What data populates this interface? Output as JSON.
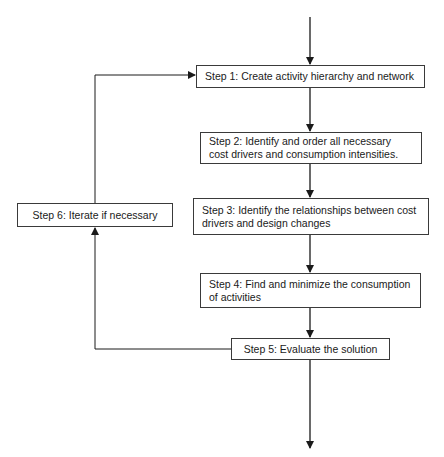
{
  "diagram": {
    "type": "flowchart",
    "steps": [
      {
        "id": "step1",
        "label": "Step 1:  Create activity hierarchy and network"
      },
      {
        "id": "step2",
        "label": "Step 2:  Identify and order all necessary cost drivers and consumption intensities."
      },
      {
        "id": "step3",
        "label": "Step 3:  Identify the relationships between cost drivers and design changes"
      },
      {
        "id": "step4",
        "label": "Step 4:  Find and minimize the consumption of activities"
      },
      {
        "id": "step5",
        "label": "Step 5:  Evaluate the solution"
      },
      {
        "id": "step6",
        "label": "Step 6: Iterate if necessary"
      }
    ],
    "edges": [
      {
        "from": "entry",
        "to": "step1"
      },
      {
        "from": "step1",
        "to": "step2"
      },
      {
        "from": "step2",
        "to": "step3"
      },
      {
        "from": "step3",
        "to": "step4"
      },
      {
        "from": "step4",
        "to": "step5"
      },
      {
        "from": "step5",
        "to": "exit"
      },
      {
        "from": "step5",
        "to": "step6"
      },
      {
        "from": "step6",
        "to": "step1"
      }
    ],
    "colors": {
      "line": "#1a1a1a",
      "box_border": "#3a3a3a",
      "background": "#ffffff"
    }
  }
}
